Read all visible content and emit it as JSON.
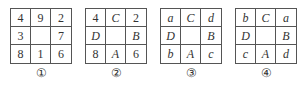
{
  "panels": [
    {
      "label": "①",
      "cells": [
        [
          "4",
          "9",
          "2"
        ],
        [
          "3",
          "",
          "7"
        ],
        [
          "8",
          "1",
          "6"
        ]
      ],
      "italic": [
        [
          false,
          false,
          false
        ],
        [
          false,
          false,
          false
        ],
        [
          false,
          false,
          false
        ]
      ]
    },
    {
      "label": "②",
      "cells": [
        [
          "4",
          "C",
          "2"
        ],
        [
          "D",
          "",
          "B"
        ],
        [
          "8",
          "A",
          "6"
        ]
      ],
      "italic": [
        [
          false,
          true,
          false
        ],
        [
          true,
          false,
          true
        ],
        [
          false,
          true,
          false
        ]
      ]
    },
    {
      "label": "③",
      "cells": [
        [
          "a",
          "C",
          "d"
        ],
        [
          "D",
          "",
          "B"
        ],
        [
          "b",
          "A",
          "c"
        ]
      ],
      "italic": [
        [
          true,
          true,
          true
        ],
        [
          true,
          false,
          true
        ],
        [
          true,
          true,
          true
        ]
      ]
    },
    {
      "label": "④",
      "cells": [
        [
          "b",
          "C",
          "a"
        ],
        [
          "D",
          "",
          "B"
        ],
        [
          "c",
          "A",
          "d"
        ]
      ],
      "italic": [
        [
          true,
          true,
          true
        ],
        [
          true,
          false,
          true
        ],
        [
          true,
          true,
          true
        ]
      ]
    }
  ]
}
